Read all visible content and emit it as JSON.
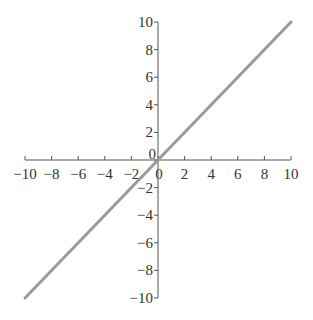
{
  "chart_data": {
    "type": "line",
    "title": "",
    "xlabel": "",
    "ylabel": "",
    "xlim": [
      -10,
      10
    ],
    "ylim": [
      -10,
      10
    ],
    "grid": false,
    "x_ticks": [
      -10,
      -8,
      -6,
      -4,
      -2,
      0,
      2,
      4,
      6,
      8,
      10
    ],
    "y_ticks": [
      -10,
      -8,
      -6,
      -4,
      -2,
      0,
      2,
      4,
      6,
      8,
      10
    ],
    "series": [
      {
        "name": "y = x",
        "x": [
          -10,
          10
        ],
        "y": [
          -10,
          10
        ],
        "color": "#9a9a9a"
      }
    ],
    "axis_color": "#555555"
  }
}
